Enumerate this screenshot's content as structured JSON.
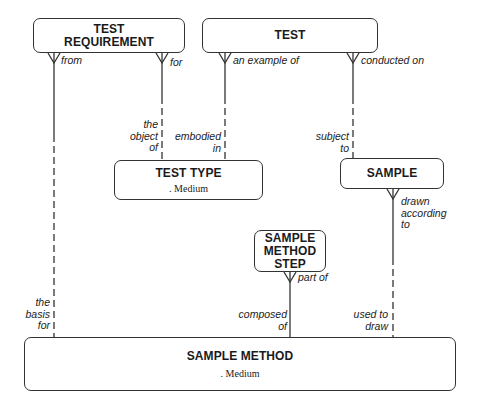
{
  "diagram": {
    "entities": {
      "test_requirement": {
        "name_line1": "TEST",
        "name_line2": "REQUIREMENT"
      },
      "test": {
        "name": "TEST"
      },
      "test_type": {
        "name": "TEST TYPE",
        "attribute": ". Medium"
      },
      "sample": {
        "name": "SAMPLE"
      },
      "sample_method_step": {
        "name_line1": "SAMPLE",
        "name_line2": "METHOD",
        "name_line3": "STEP"
      },
      "sample_method": {
        "name": "SAMPLE METHOD",
        "attribute": ". Medium"
      }
    },
    "relationships": [
      {
        "from_entity": "TEST REQUIREMENT",
        "from_label": "from",
        "to_entity": "SAMPLE METHOD",
        "to_label_lines": [
          "the",
          "basis",
          "for"
        ]
      },
      {
        "from_entity": "TEST REQUIREMENT",
        "from_label": "for",
        "to_entity": "TEST TYPE",
        "to_label_lines": [
          "the",
          "object",
          "of"
        ]
      },
      {
        "from_entity": "TEST",
        "from_label": "an example of",
        "to_entity": "TEST TYPE",
        "to_label_lines": [
          "embodied",
          "in"
        ]
      },
      {
        "from_entity": "TEST",
        "from_label": "conducted on",
        "to_entity": "SAMPLE",
        "to_label_lines": [
          "subject",
          "to"
        ]
      },
      {
        "from_entity": "SAMPLE",
        "from_label_lines": [
          "drawn",
          "according",
          "to"
        ],
        "to_entity": "SAMPLE METHOD",
        "to_label_lines": [
          "used to",
          "draw"
        ]
      },
      {
        "from_entity": "SAMPLE METHOD STEP",
        "from_label": "part of",
        "to_entity": "SAMPLE METHOD",
        "to_label_lines": [
          "composed",
          "of"
        ]
      }
    ],
    "line_color": "#333333"
  }
}
